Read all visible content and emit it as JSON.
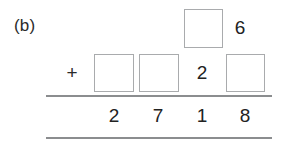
{
  "problem": {
    "part_label": "(b)",
    "operator": "+",
    "carry_row": {
      "box_placeholder": "",
      "visible_digit": "6"
    },
    "addend_row": {
      "box_1_placeholder": "",
      "box_2_placeholder": "",
      "visible_digit": "2",
      "box_3_placeholder": ""
    },
    "sum_row": {
      "digits": [
        "2",
        "7",
        "1",
        "8"
      ]
    }
  },
  "style": {
    "box_border_color": "#a9abad",
    "rule_color": "#8b8d8f",
    "text_color": "#222222",
    "background": "#ffffff"
  }
}
